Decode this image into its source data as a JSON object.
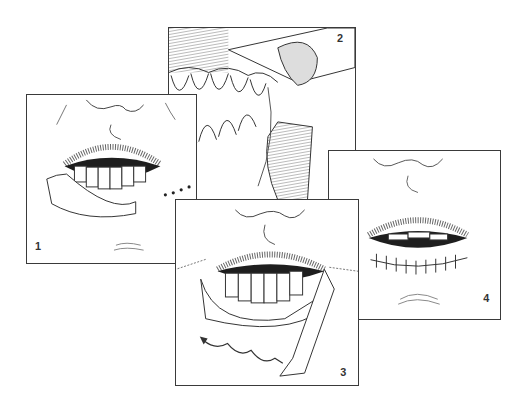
{
  "figure": {
    "panels": [
      {
        "label": "1",
        "content": "Frontal view of mouth with lower lip vermilion incised and reflected, dotted incision line at right commissure"
      },
      {
        "label": "2",
        "content": "Close-up oblique view of lower teeth and labial mucosa flap being lifted"
      },
      {
        "label": "3",
        "content": "Frontal view with mucosal flap undermined and advanced, wavy arrow indicating direction"
      },
      {
        "label": "4",
        "content": "Frontal view after closure showing sutured lower lip line"
      }
    ]
  },
  "colors": {
    "line": "#3a3a3a",
    "fill_dark": "#1e1e1e",
    "hatch": "#888888",
    "background": "#ffffff"
  }
}
